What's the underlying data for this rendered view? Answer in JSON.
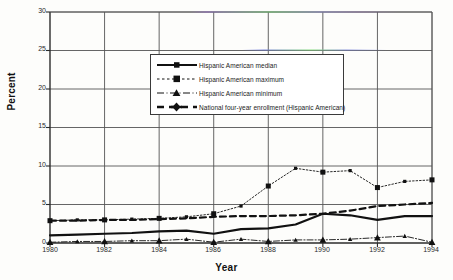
{
  "chart_data": {
    "type": "line",
    "title": "",
    "subtitle": "",
    "xlabel": "Year",
    "ylabel": "Percent",
    "xlim": [
      1980,
      1994
    ],
    "ylim": [
      0,
      30
    ],
    "grid": true,
    "legend_position": "upper-center",
    "x": [
      1980,
      1981,
      1982,
      1983,
      1984,
      1985,
      1986,
      1987,
      1988,
      1989,
      1990,
      1991,
      1992,
      1993,
      1994
    ],
    "xticks": [
      "1980",
      "1982",
      "1984",
      "1986",
      "1988",
      "1990",
      "1992",
      "1994"
    ],
    "xtick_values": [
      1980,
      1982,
      1984,
      1986,
      1988,
      1990,
      1992,
      1994
    ],
    "yticks": [
      "0",
      "5",
      "10",
      "15",
      "20",
      "25",
      "30"
    ],
    "ytick_values": [
      0,
      5,
      10,
      15,
      20,
      25,
      30
    ],
    "series": [
      {
        "name": "Hispanic American median",
        "style": "solid-thick",
        "marker": "none",
        "values": [
          1.0,
          1.1,
          1.2,
          1.3,
          1.5,
          1.6,
          1.2,
          1.8,
          1.9,
          2.4,
          3.8,
          3.6,
          3.0,
          3.5,
          3.5
        ]
      },
      {
        "name": "Hispanic American maximum",
        "style": "dotted",
        "marker": "square",
        "values": [
          2.9,
          3.0,
          3.0,
          3.1,
          3.2,
          3.4,
          3.8,
          4.8,
          7.4,
          9.7,
          9.2,
          9.4,
          7.2,
          8.0,
          8.2
        ]
      },
      {
        "name": "Hispanic American minimum",
        "style": "dash-dot",
        "marker": "triangle",
        "values": [
          0.1,
          0.2,
          0.2,
          0.3,
          0.3,
          0.5,
          0.1,
          0.5,
          0.2,
          0.4,
          0.4,
          0.5,
          0.7,
          0.9,
          0.1
        ]
      },
      {
        "name": "National four-year enrollment (Hispanic American)",
        "style": "dashed-thick",
        "marker": "none",
        "values": [
          2.9,
          2.9,
          3.0,
          3.0,
          3.1,
          3.2,
          3.4,
          3.5,
          3.5,
          3.6,
          3.8,
          4.2,
          4.8,
          5.0,
          5.2
        ]
      }
    ]
  },
  "legend": {
    "items": [
      {
        "label": "Hispanic American median"
      },
      {
        "label": "Hispanic American maximum"
      },
      {
        "label": "Hispanic American minimum"
      },
      {
        "label": "National four-year enrollment (Hispanic American)"
      }
    ]
  },
  "colors": {
    "line": "#111111",
    "grid": "#555555",
    "axis": "#2b2b2b",
    "background": "#fdfdfb"
  }
}
